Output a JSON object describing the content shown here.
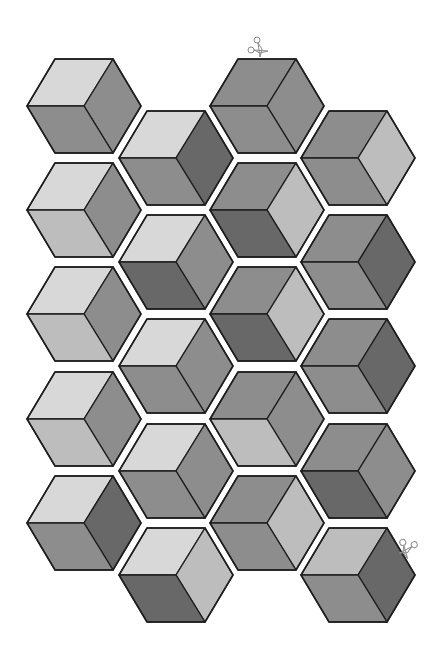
{
  "sheet": {
    "title": "Hexagon cube quilt template",
    "background": "#ffffff",
    "outline_color": "#1e1e1e"
  },
  "palette": {
    "A": "#d8d8d8",
    "B": "#bdbdbd",
    "D": "#8d8d8d",
    "F": "#686868"
  },
  "geometry": {
    "half_width": 57,
    "top_half_length": 29,
    "half_height": 47
  },
  "hexagons": [
    {
      "col": 0,
      "row": 0,
      "cx": 84,
      "cy": 106,
      "top": "A",
      "right": "D",
      "left": "D"
    },
    {
      "col": 0,
      "row": 1,
      "cx": 84,
      "cy": 210,
      "top": "A",
      "right": "D",
      "left": "B"
    },
    {
      "col": 0,
      "row": 2,
      "cx": 84,
      "cy": 314,
      "top": "A",
      "right": "D",
      "left": "B"
    },
    {
      "col": 0,
      "row": 3,
      "cx": 84,
      "cy": 419,
      "top": "A",
      "right": "D",
      "left": "B"
    },
    {
      "col": 0,
      "row": 4,
      "cx": 84,
      "cy": 523,
      "top": "A",
      "right": "F",
      "left": "D"
    },
    {
      "col": 1,
      "row": 0,
      "cx": 176,
      "cy": 158,
      "top": "A",
      "right": "F",
      "left": "D"
    },
    {
      "col": 1,
      "row": 1,
      "cx": 176,
      "cy": 262,
      "top": "A",
      "right": "D",
      "left": "F"
    },
    {
      "col": 1,
      "row": 2,
      "cx": 176,
      "cy": 366,
      "top": "A",
      "right": "D",
      "left": "D"
    },
    {
      "col": 1,
      "row": 3,
      "cx": 176,
      "cy": 471,
      "top": "A",
      "right": "D",
      "left": "D"
    },
    {
      "col": 1,
      "row": 4,
      "cx": 176,
      "cy": 575,
      "top": "A",
      "right": "B",
      "left": "F"
    },
    {
      "col": 2,
      "row": 0,
      "cx": 267,
      "cy": 106,
      "top": "D",
      "right": "D",
      "left": "D"
    },
    {
      "col": 2,
      "row": 1,
      "cx": 267,
      "cy": 210,
      "top": "D",
      "right": "B",
      "left": "F"
    },
    {
      "col": 2,
      "row": 2,
      "cx": 267,
      "cy": 314,
      "top": "D",
      "right": "B",
      "left": "F"
    },
    {
      "col": 2,
      "row": 3,
      "cx": 267,
      "cy": 419,
      "top": "D",
      "right": "D",
      "left": "B"
    },
    {
      "col": 2,
      "row": 4,
      "cx": 267,
      "cy": 523,
      "top": "D",
      "right": "B",
      "left": "D"
    },
    {
      "col": 3,
      "row": 0,
      "cx": 358,
      "cy": 158,
      "top": "D",
      "right": "B",
      "left": "D"
    },
    {
      "col": 3,
      "row": 1,
      "cx": 358,
      "cy": 262,
      "top": "D",
      "right": "F",
      "left": "D"
    },
    {
      "col": 3,
      "row": 2,
      "cx": 358,
      "cy": 366,
      "top": "D",
      "right": "F",
      "left": "D"
    },
    {
      "col": 3,
      "row": 3,
      "cx": 358,
      "cy": 471,
      "top": "D",
      "right": "D",
      "left": "F"
    },
    {
      "col": 3,
      "row": 4,
      "cx": 358,
      "cy": 575,
      "top": "B",
      "right": "F",
      "left": "D"
    }
  ],
  "scissors": [
    {
      "name": "scissors-top",
      "x": 258,
      "y": 47,
      "rotate": 0
    },
    {
      "name": "scissors-right",
      "x": 408,
      "y": 548,
      "rotate": 70
    }
  ]
}
